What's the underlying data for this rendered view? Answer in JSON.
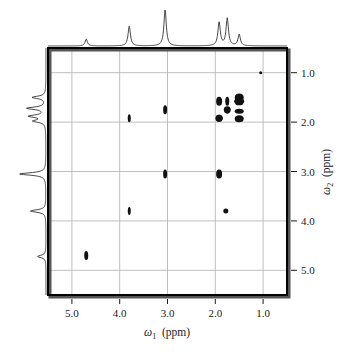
{
  "figure": {
    "type": "2d-nmr-spectrum",
    "background_color": "#ffffff",
    "frame_color": "#000000",
    "grid_color": "#b8b8b8",
    "peak_color": "#111111",
    "trace_color": "#1a1a1a"
  },
  "axes": {
    "x": {
      "label_omega": "ω",
      "label_sub": "1",
      "label_units": "(ppm)",
      "full_label": "ω₁ (ppm)",
      "ticks": [
        "5.0",
        "4.0",
        "3.0",
        "2.0",
        "1.0"
      ],
      "tick_values": [
        5.0,
        4.0,
        3.0,
        2.0,
        1.0
      ],
      "range": [
        5.5,
        0.5
      ],
      "direction": "decreasing"
    },
    "y": {
      "label_omega": "ω",
      "label_sub": "2",
      "label_units": "(ppm)",
      "full_label": "ω₂ (ppm)",
      "ticks": [
        "1.0",
        "2.0",
        "3.0",
        "4.0",
        "5.0"
      ],
      "tick_values": [
        1.0,
        2.0,
        3.0,
        4.0,
        5.0
      ],
      "range": [
        0.5,
        5.5
      ],
      "direction": "increasing-downward",
      "side": "right"
    }
  },
  "chart_data": {
    "type": "scatter",
    "title": "",
    "xlabel": "ω₁ (ppm)",
    "ylabel": "ω₂ (ppm)",
    "xlim": [
      5.5,
      0.5
    ],
    "ylim": [
      5.5,
      0.5
    ],
    "grid": true,
    "legend": "none",
    "series": [
      {
        "name": "diagonal-peaks",
        "points": [
          {
            "x": 4.7,
            "y": 4.7,
            "w": 4,
            "h": 9
          },
          {
            "x": 3.8,
            "y": 3.8,
            "w": 3,
            "h": 8
          },
          {
            "x": 3.05,
            "y": 3.05,
            "w": 4,
            "h": 9
          },
          {
            "x": 1.92,
            "y": 1.92,
            "w": 7,
            "h": 7
          },
          {
            "x": 1.75,
            "y": 1.75,
            "w": 7,
            "h": 7
          },
          {
            "x": 1.5,
            "y": 1.5,
            "w": 9,
            "h": 8
          },
          {
            "x": 1.05,
            "y": 1.0,
            "w": 3,
            "h": 3
          }
        ]
      },
      {
        "name": "cross-peaks",
        "points": [
          {
            "x": 3.05,
            "y": 1.75,
            "w": 4,
            "h": 9
          },
          {
            "x": 3.8,
            "y": 1.92,
            "w": 3,
            "h": 8
          },
          {
            "x": 1.92,
            "y": 3.05,
            "w": 6,
            "h": 9
          },
          {
            "x": 1.78,
            "y": 3.8,
            "w": 5,
            "h": 5
          },
          {
            "x": 1.92,
            "y": 1.58,
            "w": 6,
            "h": 9
          },
          {
            "x": 1.92,
            "y": 1.92,
            "w": 7,
            "h": 7
          },
          {
            "x": 1.75,
            "y": 1.58,
            "w": 4,
            "h": 9
          },
          {
            "x": 1.75,
            "y": 1.78,
            "w": 4,
            "h": 5
          },
          {
            "x": 1.5,
            "y": 1.58,
            "w": 10,
            "h": 8
          },
          {
            "x": 1.5,
            "y": 1.78,
            "w": 9,
            "h": 5
          },
          {
            "x": 1.5,
            "y": 1.93,
            "w": 9,
            "h": 7
          }
        ]
      }
    ],
    "projections": {
      "top": {
        "name": "f1-projection-trace",
        "peaks": [
          {
            "ppm": 4.7,
            "height": 0.18
          },
          {
            "ppm": 3.8,
            "height": 0.52
          },
          {
            "ppm": 3.05,
            "height": 0.95
          },
          {
            "ppm": 1.92,
            "height": 0.62
          },
          {
            "ppm": 1.75,
            "height": 0.72
          },
          {
            "ppm": 1.5,
            "height": 0.3
          }
        ]
      },
      "left": {
        "name": "f2-projection-trace",
        "peaks": [
          {
            "ppm": 1.5,
            "height": 0.45
          },
          {
            "ppm": 1.72,
            "height": 0.62
          },
          {
            "ppm": 1.88,
            "height": 0.55
          },
          {
            "ppm": 1.98,
            "height": 0.4
          },
          {
            "ppm": 3.05,
            "height": 0.88
          },
          {
            "ppm": 3.8,
            "height": 0.52
          },
          {
            "ppm": 4.72,
            "height": 0.28
          }
        ]
      }
    }
  }
}
